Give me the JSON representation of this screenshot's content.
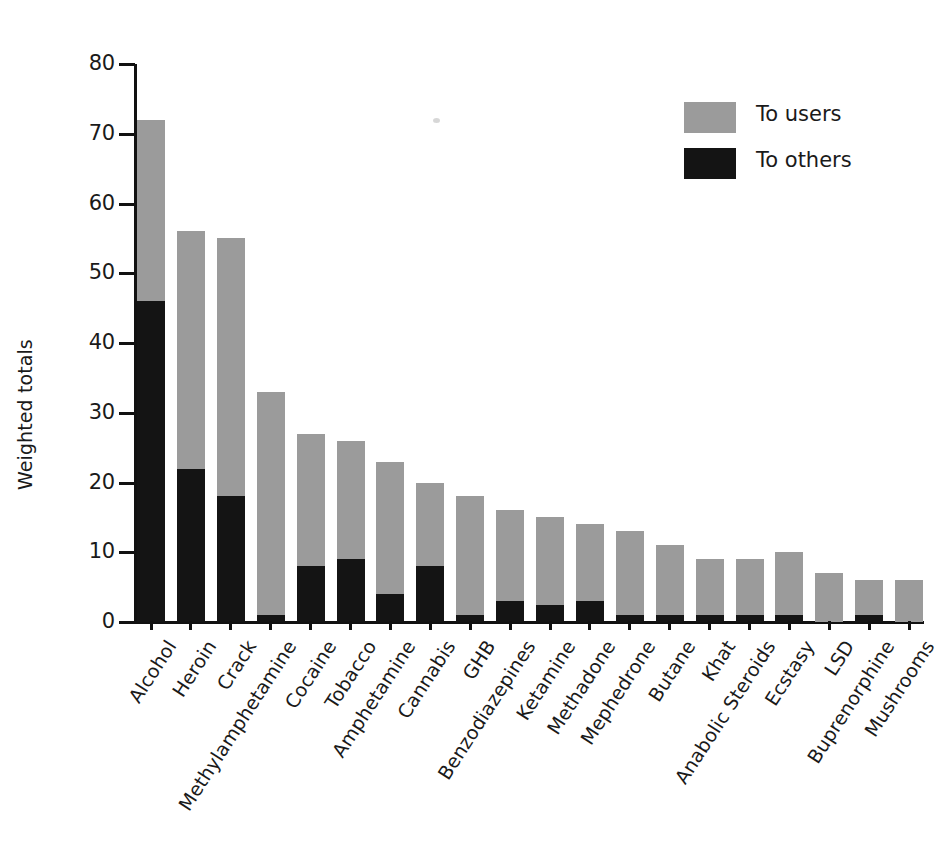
{
  "chart_data": {
    "type": "bar",
    "stacked": true,
    "title": "",
    "subtitle": "",
    "xlabel": "",
    "ylabel": "Weighted totals",
    "ylim": [
      0,
      80
    ],
    "ytick_labels": [
      "0",
      "10",
      "20",
      "30",
      "40",
      "50",
      "60",
      "70",
      "80"
    ],
    "ytick_values": [
      0,
      10,
      20,
      30,
      40,
      50,
      60,
      70,
      80
    ],
    "grid": false,
    "legend_position": "top-right",
    "categories": [
      "Alcohol",
      "Heroin",
      "Crack",
      "Methylamphetamine",
      "Cocaine",
      "Tobacco",
      "Amphetamine",
      "Cannabis",
      "GHB",
      "Benzodiazepines",
      "Ketamine",
      "Methadone",
      "Mephedrone",
      "Butane",
      "Khat",
      "Anabolic Steroids",
      "Ecstasy",
      "LSD",
      "Buprenorphine",
      "Mushrooms"
    ],
    "series": [
      {
        "name": "To others",
        "color": "#141414",
        "values": [
          46,
          22,
          18,
          1,
          8,
          9,
          4,
          8,
          1,
          3,
          2.5,
          3,
          1,
          1,
          1,
          1,
          1,
          0,
          1,
          0
        ]
      },
      {
        "name": "To users",
        "color": "#9b9b9b",
        "values": [
          26,
          34,
          37,
          32,
          19,
          17,
          19,
          12,
          17,
          13,
          12.5,
          11,
          12,
          10,
          8,
          8,
          9,
          7,
          5,
          6
        ]
      }
    ],
    "totals": [
      72,
      56,
      55,
      33,
      27,
      26,
      23,
      20,
      18,
      16,
      15,
      14,
      13,
      11,
      9,
      9,
      10,
      7,
      6,
      6
    ]
  },
  "legend": {
    "entries": [
      {
        "label": "To users",
        "color": "#9b9b9b",
        "swatch": "users"
      },
      {
        "label": "To others",
        "color": "#141414",
        "swatch": "others"
      }
    ]
  },
  "colors": {
    "to_users": "#9b9b9b",
    "to_others": "#141414",
    "axis": "#111111",
    "text": "#1a1a1a",
    "background": "#ffffff"
  }
}
